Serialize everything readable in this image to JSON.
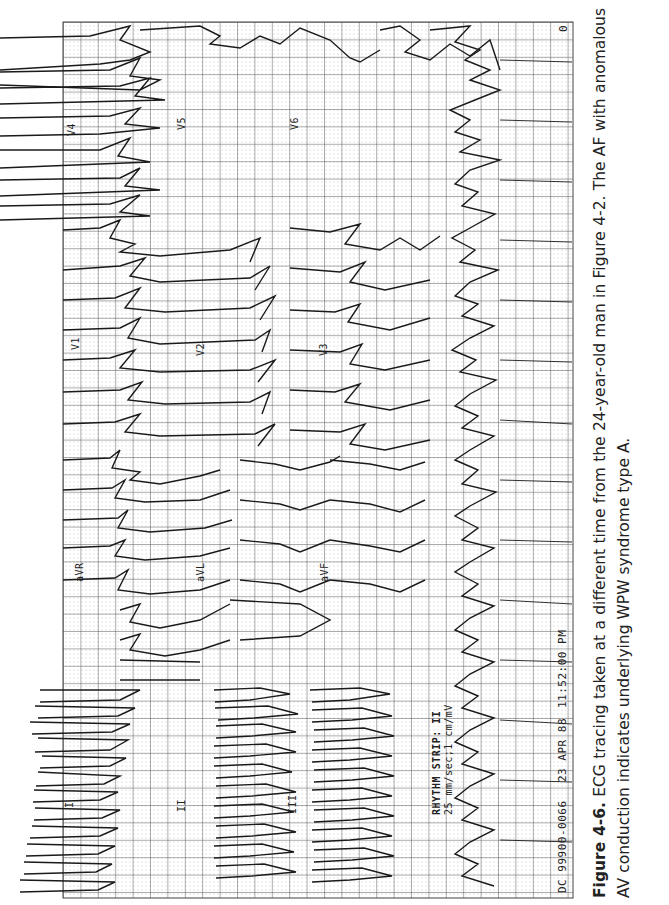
{
  "figure": {
    "number": "Figure 4-6.",
    "caption_text": " ECG tracing taken at a different time from the 24-year-old man in Figure 4-2. The AF with anomalous AV conduction indicates underlying WPW syndrome type A."
  },
  "ecg": {
    "lead_labels": {
      "I": "I",
      "II": "II",
      "III": "III",
      "aVR": "aVR",
      "aVL": "aVL",
      "aVF": "aVF",
      "V1": "V1",
      "V2": "V2",
      "V3": "V3",
      "V4": "V4",
      "V5": "V5",
      "V6": "V6"
    },
    "rhythm_strip": {
      "title": "RHYTHM STRIP: II",
      "settings": "25 mm/sec;1 cm/mV"
    },
    "footer": {
      "id": "DC 99900-0066",
      "date": "23 APR 88",
      "time": "11:52:00 PM"
    },
    "page_marker": "0",
    "grid_color": "#555555",
    "trace_color": "#1a1a1a"
  }
}
